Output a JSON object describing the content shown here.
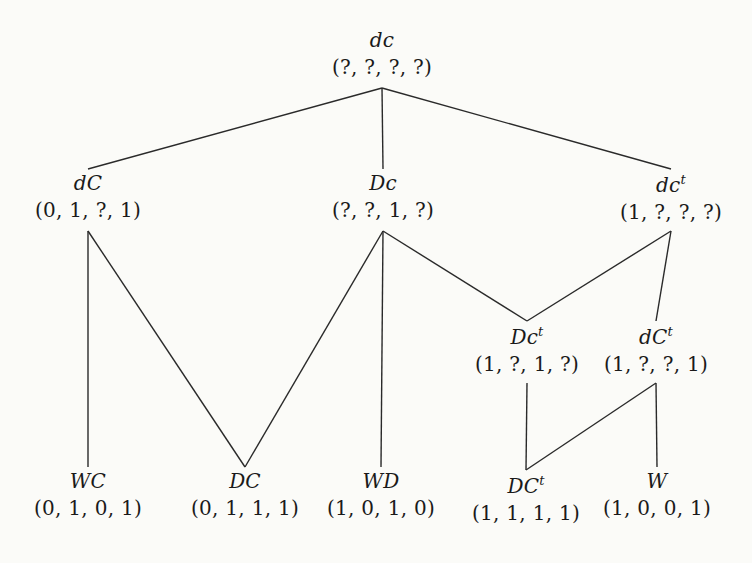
{
  "diagram": {
    "type": "hasse-lattice",
    "background_color": "#fbfbf8",
    "line_color": "#2a2a2a",
    "text_color": "#1a1a1a",
    "nodes": [
      {
        "id": "dc",
        "label": "dc",
        "sup": "",
        "tuple": "(?, ?, ?, ?)",
        "x": 382,
        "y": 30,
        "level": 0
      },
      {
        "id": "dC",
        "label": "dC",
        "sup": "",
        "tuple": "(0, 1, ?, 1)",
        "x": 88,
        "y": 173,
        "level": 1
      },
      {
        "id": "Dc",
        "label": "Dc",
        "sup": "",
        "tuple": "(?, ?, 1, ?)",
        "x": 383,
        "y": 173,
        "level": 1
      },
      {
        "id": "dct",
        "label": "dc",
        "sup": "t",
        "tuple": "(1, ?, ?, ?)",
        "x": 671,
        "y": 173,
        "level": 1
      },
      {
        "id": "Dct",
        "label": "Dc",
        "sup": "t",
        "tuple": "(1, ?, 1, ?)",
        "x": 527,
        "y": 325,
        "level": 2
      },
      {
        "id": "dCt",
        "label": "dC",
        "sup": "t",
        "tuple": "(1, ?, ?, 1)",
        "x": 656,
        "y": 325,
        "level": 2
      },
      {
        "id": "WC",
        "label": "WC",
        "sup": "",
        "tuple": "(0, 1, 0, 1)",
        "x": 88,
        "y": 471,
        "level": 3
      },
      {
        "id": "DC",
        "label": "DC",
        "sup": "",
        "tuple": "(0, 1, 1, 1)",
        "x": 245,
        "y": 471,
        "level": 3
      },
      {
        "id": "WD",
        "label": "WD",
        "sup": "",
        "tuple": "(1, 0, 1, 0)",
        "x": 381,
        "y": 471,
        "level": 3
      },
      {
        "id": "DCt",
        "label": "DC",
        "sup": "t",
        "tuple": "(1, 1, 1, 1)",
        "x": 526,
        "y": 474,
        "level": 3
      },
      {
        "id": "W",
        "label": "W",
        "sup": "",
        "tuple": "(1, 0, 0, 1)",
        "x": 657,
        "y": 471,
        "level": 3
      }
    ],
    "edges": [
      {
        "from": "dc",
        "to": "dC"
      },
      {
        "from": "dc",
        "to": "Dc"
      },
      {
        "from": "dc",
        "to": "dct"
      },
      {
        "from": "dC",
        "to": "WC"
      },
      {
        "from": "dC",
        "to": "DC"
      },
      {
        "from": "Dc",
        "to": "DC"
      },
      {
        "from": "Dc",
        "to": "WD"
      },
      {
        "from": "Dc",
        "to": "Dct"
      },
      {
        "from": "dct",
        "to": "Dct"
      },
      {
        "from": "dct",
        "to": "dCt"
      },
      {
        "from": "Dct",
        "to": "DCt"
      },
      {
        "from": "dCt",
        "to": "DCt"
      },
      {
        "from": "dCt",
        "to": "W"
      }
    ]
  }
}
